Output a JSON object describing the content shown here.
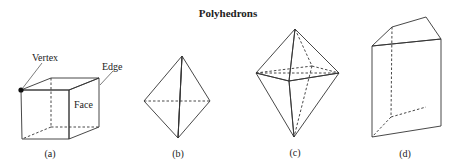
{
  "title": "Polyhedrons",
  "figures": [
    {
      "id": "a",
      "caption": "(a)",
      "shape": "cube",
      "annotations": {
        "vertex": "Vertex",
        "edge": "Edge",
        "face": "Face"
      }
    },
    {
      "id": "b",
      "caption": "(b)",
      "shape": "triangular-bipyramid"
    },
    {
      "id": "c",
      "caption": "(c)",
      "shape": "quadrilateral-bipyramid"
    },
    {
      "id": "d",
      "caption": "(d)",
      "shape": "truncated-prism"
    }
  ],
  "colors": {
    "face_dark": "#7a7a7a",
    "face_mid": "#9a9a9a",
    "face_light": "#bdbdbd",
    "edge": "#333333",
    "background": "#ffffff"
  }
}
